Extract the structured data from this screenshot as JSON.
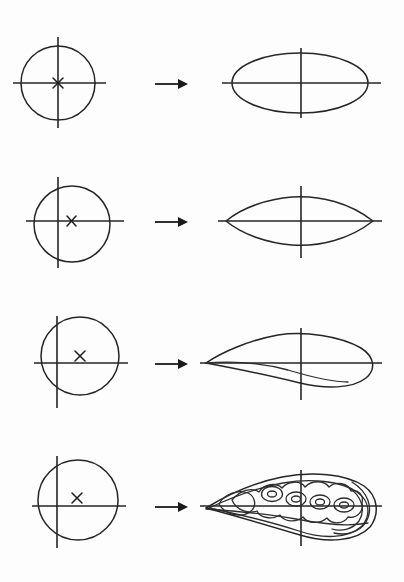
{
  "figure": {
    "background_color": "#fdfdfd",
    "line_color": "#252525",
    "width": 404,
    "height": 582,
    "row_count": 4
  },
  "rows": [
    {
      "id": "row-1",
      "source": {
        "shape": "circle",
        "center": [
          58,
          83
        ],
        "radius": 37,
        "offset_marker": "x-marker",
        "marker_position": [
          58,
          83
        ],
        "marker_label": "x",
        "axes": {
          "horizontal_y": 83,
          "horizontal_x1": 13,
          "horizontal_x2": 106,
          "vertical_x": 58,
          "vertical_y1": 37,
          "vertical_y2": 128
        }
      },
      "arrow": {
        "x1": 155,
        "x2": 186,
        "y": 84,
        "glyph": "arrow-right"
      },
      "result": {
        "shape": "ellipse",
        "label": "symmetric ellipse",
        "center": [
          300,
          83
        ],
        "rx": 68,
        "ry": 30,
        "axes": {
          "horizontal_y": 83,
          "horizontal_x1": 222,
          "horizontal_x2": 381,
          "vertical_x": 301,
          "vertical_y1": 48,
          "vertical_y2": 118
        }
      }
    },
    {
      "id": "row-2",
      "source": {
        "shape": "circle",
        "center": [
          72,
          224
        ],
        "radius": 38,
        "offset_marker": "x-marker",
        "marker_position": [
          71,
          221
        ],
        "marker_label": "x",
        "axes": {
          "horizontal_y": 221,
          "horizontal_x1": 26,
          "horizontal_x2": 124,
          "vertical_x": 58,
          "vertical_y1": 177,
          "vertical_y2": 268
        }
      },
      "arrow": {
        "x1": 155,
        "x2": 186,
        "y": 222,
        "glyph": "arrow-right"
      },
      "result": {
        "shape": "symmetric-airfoil",
        "label": "symmetric lens airfoil",
        "leading_edge": [
          226,
          221
        ],
        "trailing_edge": [
          373,
          221
        ],
        "max_thickness_y_top": 197,
        "max_thickness_y_bottom": 245,
        "axes": {
          "horizontal_y": 221,
          "horizontal_x1": 218,
          "horizontal_x2": 382,
          "vertical_x": 301,
          "vertical_y1": 186,
          "vertical_y2": 258
        }
      }
    },
    {
      "id": "row-3",
      "source": {
        "shape": "circle",
        "center": [
          80,
          356
        ],
        "radius": 39,
        "offset_marker": "x-marker",
        "marker_position": [
          80,
          356
        ],
        "marker_label": "x",
        "axes": {
          "horizontal_y": 363,
          "horizontal_x1": 34,
          "horizontal_x2": 128,
          "vertical_x": 57,
          "vertical_y1": 316,
          "vertical_y2": 408
        }
      },
      "arrow": {
        "x1": 155,
        "x2": 186,
        "y": 364,
        "glyph": "arrow-right"
      },
      "result": {
        "shape": "cambered-airfoil",
        "label": "cambered airfoil",
        "leading_edge": [
          206,
          363
        ],
        "trailing_edge": [
          374,
          363
        ],
        "camber_peak": [
          292,
          335
        ],
        "lower_dip": [
          318,
          382
        ],
        "axes": {
          "horizontal_y": 363,
          "horizontal_x1": 200,
          "horizontal_x2": 382,
          "vertical_x": 301,
          "vertical_y1": 328,
          "vertical_y2": 400
        }
      }
    },
    {
      "id": "row-4",
      "source": {
        "shape": "circle",
        "center": [
          78,
          500
        ],
        "radius": 40,
        "offset_marker": "x-marker",
        "marker_position": [
          77,
          498
        ],
        "marker_label": "x",
        "axes": {
          "horizontal_y": 506,
          "horizontal_x1": 32,
          "horizontal_x2": 126,
          "vertical_x": 57,
          "vertical_y1": 456,
          "vertical_y2": 548
        }
      },
      "arrow": {
        "x1": 155,
        "x2": 186,
        "y": 507,
        "glyph": "arrow-right"
      },
      "result": {
        "shape": "larva-airfoil",
        "label": "highly cambered lobed airfoil with inner contours",
        "leading_edge": [
          206,
          508
        ],
        "trailing_edge": [
          372,
          508
        ],
        "inner_contours": 3,
        "inner_spots": 4,
        "spot_positions": [
          [
            272,
            494
          ],
          [
            295,
            499
          ],
          [
            320,
            502
          ],
          [
            344,
            505
          ]
        ],
        "axes": {
          "horizontal_y": 506,
          "horizontal_x1": 200,
          "horizontal_x2": 382,
          "vertical_x": 301,
          "vertical_y1": 470,
          "vertical_y2": 546
        }
      }
    }
  ]
}
